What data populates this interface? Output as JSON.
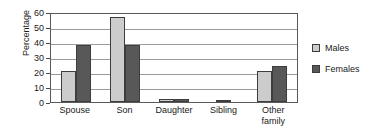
{
  "chart_data": {
    "type": "bar",
    "title": "",
    "subtitle": "",
    "xlabel": "",
    "ylabel": "Percentage",
    "ylim": [
      0,
      60
    ],
    "yticks": [
      0,
      10,
      20,
      30,
      40,
      50,
      60
    ],
    "grid": true,
    "legend_position": "right",
    "categories": [
      "Spouse",
      "Son",
      "Daughter",
      "Sibling",
      "Other family"
    ],
    "category_lines": [
      [
        "Spouse"
      ],
      [
        "Son"
      ],
      [
        "Daughter"
      ],
      [
        "Sibling"
      ],
      [
        "Other",
        "family"
      ]
    ],
    "series": [
      {
        "name": "Males",
        "color": "#cccccc",
        "values": [
          21,
          57,
          2,
          0,
          21
        ]
      },
      {
        "name": "Females",
        "color": "#585858",
        "values": [
          38,
          38,
          2,
          1,
          24
        ]
      }
    ]
  },
  "legend": {
    "items": [
      {
        "label": "Males",
        "color": "#cccccc"
      },
      {
        "label": "Females",
        "color": "#585858"
      }
    ]
  },
  "colors": {
    "males_bar": "#cccccc",
    "females_bar": "#585858",
    "bar_outline": "#3d3d3d",
    "gridline": "#9a9a9a",
    "axis": "#5a5a5a",
    "text": "#1a1a1a",
    "background": "#ffffff"
  }
}
